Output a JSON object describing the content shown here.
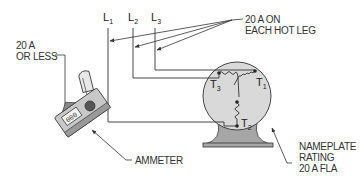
{
  "lines": {
    "l1": {
      "main": "L",
      "sub": "1"
    },
    "l2": {
      "main": "L",
      "sub": "2"
    },
    "l3": {
      "main": "L",
      "sub": "3"
    }
  },
  "terminals": {
    "t1": {
      "main": "T",
      "sub": "1"
    },
    "t2": {
      "main": "T",
      "sub": "2"
    },
    "t3": {
      "main": "T",
      "sub": "3"
    }
  },
  "callouts": {
    "hot_leg": {
      "line1": "20 A ON",
      "line2": "EACH HOT LEG"
    },
    "or_less": {
      "line1": "20 A",
      "line2": "OR LESS"
    },
    "ammeter": {
      "line1": "AMMETER"
    },
    "nameplate": {
      "line1": "NAMEPLATE",
      "line2": "RATING",
      "line3": "20 A FLA"
    }
  },
  "colors": {
    "line": "#333333",
    "motor_fill": "#d9d9d9",
    "base_fill": "#a6a6a6",
    "meter_body": "#c8c8c8",
    "meter_dark": "#555555"
  }
}
